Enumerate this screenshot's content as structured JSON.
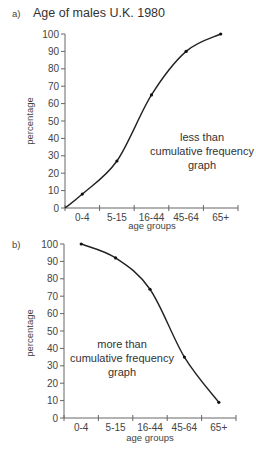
{
  "chart_data": [
    {
      "type": "line",
      "panel_label": "a)",
      "title": "Age of males U.K. 1980",
      "xlabel": "age groups",
      "ylabel": "percentage",
      "categories": [
        "0-4",
        "5-15",
        "16-44",
        "45-64",
        "65+"
      ],
      "y_ticks": [
        0,
        10,
        20,
        30,
        40,
        50,
        60,
        70,
        80,
        90,
        100
      ],
      "ylim": [
        0,
        100
      ],
      "start_value": 0,
      "series": [
        {
          "name": "less than cumulative frequency",
          "values": [
            8,
            27,
            65,
            90,
            100
          ]
        }
      ],
      "annotation": [
        "less than",
        "cumulative frequency",
        "graph"
      ],
      "grid": false
    },
    {
      "type": "line",
      "panel_label": "b)",
      "title": "",
      "xlabel": "age groups",
      "ylabel": "percentage",
      "categories": [
        "0-4",
        "5-15",
        "16-44",
        "45-64",
        "65+"
      ],
      "y_ticks": [
        0,
        10,
        20,
        30,
        40,
        50,
        60,
        70,
        80,
        90,
        100
      ],
      "ylim": [
        0,
        100
      ],
      "series": [
        {
          "name": "more than cumulative frequency",
          "values": [
            100,
            92,
            74,
            35,
            9
          ]
        }
      ],
      "annotation": [
        "more than",
        "cumulative frequency",
        "graph"
      ],
      "grid": false
    }
  ]
}
